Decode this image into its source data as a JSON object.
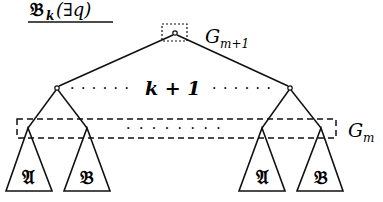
{
  "title": {
    "main": "𝔅",
    "subscript": "k",
    "argument": "(∃q)"
  },
  "root": {
    "group_label": "G",
    "group_subscript": "m+1"
  },
  "children_count_label": "k + 1",
  "children_dots": "· · · · · ·",
  "lower_group": {
    "label": "G",
    "subscript": "m",
    "dots": "· · · · · · · ·"
  },
  "subtrees": [
    {
      "label": "𝔄"
    },
    {
      "label": "𝔅"
    },
    {
      "label": "𝔄"
    },
    {
      "label": "𝔅"
    }
  ],
  "colors": {
    "stroke": "#111111",
    "background": "#ffffff"
  }
}
